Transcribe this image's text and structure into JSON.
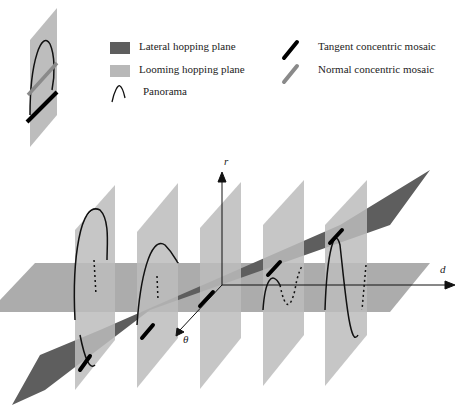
{
  "legend": {
    "items": [
      {
        "label": "Lateral hopping plane",
        "icon": "dark-gray-swatch"
      },
      {
        "label": "Looming hopping plane",
        "icon": "light-gray-swatch"
      },
      {
        "label": "Panorama",
        "icon": "sine-curve"
      },
      {
        "label": "Tangent concentric mosaic",
        "icon": "black-bar"
      },
      {
        "label": "Normal concentric mosaic",
        "icon": "gray-bar"
      }
    ]
  },
  "axes": {
    "r": "r",
    "d": "d",
    "theta": "θ"
  },
  "colors": {
    "lateral": "#5e5e5e",
    "looming": "#b8b8b8",
    "horizontal": "#a4a4a4",
    "tangent": "#000000",
    "normal": "#8a8a8a"
  }
}
